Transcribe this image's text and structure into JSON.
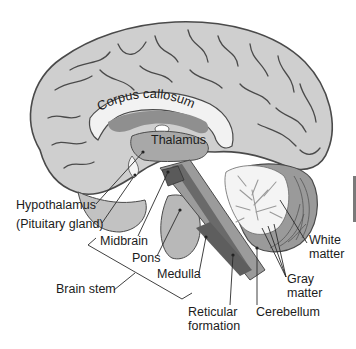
{
  "figure": {
    "colors": {
      "cerebrum": "#cfcfcf",
      "cerebrum_outline": "#4a4a4a",
      "corpus_callosum": "#f2f2f2",
      "ventricle": "#8f8f8f",
      "thalamus_region": "#a8a8a8",
      "brain_stem": "#bdbdbd",
      "reticular_formation": "#5e5e5e",
      "cerebellum_gray": "#9a9a9a",
      "cerebellum_white": "#f4f4f4",
      "text": "#1c1c1c",
      "leader_lines": "#2a2a2a"
    }
  },
  "labels": {
    "corpus_callosum": "Corpus callosum",
    "thalamus": "Thalamus",
    "hypothalamus": "Hypothalamus",
    "pituitary": "(Pituitary gland)",
    "midbrain": "Midbrain",
    "pons": "Pons",
    "medulla": "Medulla",
    "brain_stem": "Brain stem",
    "reticular_line1": "Reticular",
    "reticular_line2": "formation",
    "cerebellum": "Cerebellum",
    "white_line1": "White",
    "white_line2": "matter",
    "gray_line1": "Gray",
    "gray_line2": "matter"
  }
}
